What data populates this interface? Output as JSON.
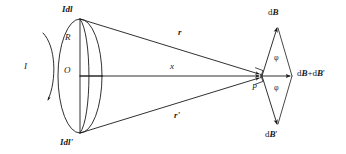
{
  "figure": {
    "type": "physics-diagram",
    "background_color": "#ffffff",
    "stroke_color": "#1a1a1a"
  },
  "labels": {
    "current_element_top": "Idl",
    "current_element_bottom": "Idl'",
    "radius": "R",
    "center": "O",
    "current": "I",
    "axial_distance": "x",
    "vector_r": "r",
    "vector_r_prime": "r'",
    "field_top": "dB",
    "field_bottom": "dB'",
    "field_resultant": "dB+dB'",
    "angle_upper": "φ",
    "angle_lower": "φ",
    "field_point": "P"
  },
  "geometry": {
    "loop_center": [
      80,
      76
    ],
    "loop_semi_axis_x": 22,
    "loop_semi_axis_y": 57,
    "loop_top": [
      80,
      19
    ],
    "loop_bottom": [
      80,
      133
    ],
    "field_point": [
      262,
      76
    ],
    "axis_start": [
      80,
      76
    ],
    "axis_end": [
      258,
      76
    ],
    "vector_top_tip": [
      278,
      27
    ],
    "vector_bottom_tip": [
      278,
      125
    ],
    "vector_resultant_tip": [
      294,
      76
    ]
  },
  "icons": {
    "current_direction": "curved-arrow-icon",
    "right_angle_marker": "right-angle-icon",
    "vector_arrowhead": "arrowhead-icon"
  }
}
